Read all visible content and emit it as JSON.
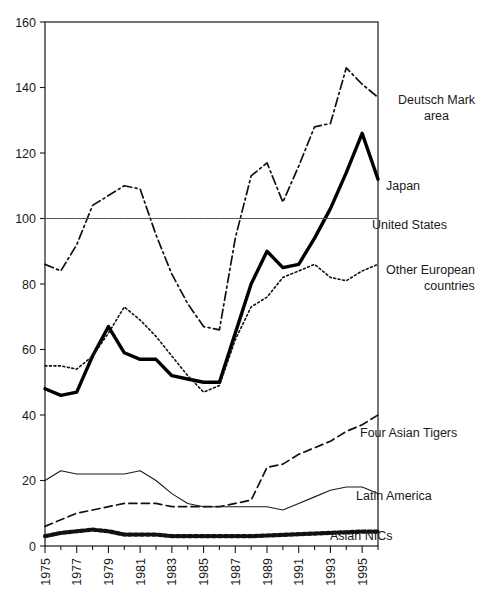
{
  "chart_data": {
    "type": "line",
    "title": "",
    "xlabel": "",
    "ylabel": "",
    "xlim": [
      1975,
      1996
    ],
    "ylim": [
      0,
      160
    ],
    "grid": false,
    "legend_position": "right-inline-labels",
    "x": [
      1975,
      1976,
      1977,
      1978,
      1979,
      1980,
      1981,
      1982,
      1983,
      1984,
      1985,
      1986,
      1987,
      1988,
      1989,
      1990,
      1991,
      1992,
      1993,
      1994,
      1995,
      1996
    ],
    "xtick_labels": [
      "1975",
      "1977",
      "1979",
      "1981",
      "1983",
      "1985",
      "1987",
      "1989",
      "1991",
      "1993",
      "1995"
    ],
    "xtick_values": [
      1975,
      1977,
      1979,
      1981,
      1983,
      1985,
      1987,
      1989,
      1991,
      1993,
      1995
    ],
    "ytick_labels": [
      "0",
      "20",
      "40",
      "60",
      "80",
      "100",
      "120",
      "140",
      "160"
    ],
    "ytick_values": [
      0,
      20,
      40,
      60,
      80,
      100,
      120,
      140,
      160
    ],
    "series": [
      {
        "name": "Deutsch Mark area",
        "label": "Deutsch Mark area",
        "label_lines": [
          "Deutsch Mark",
          "area"
        ],
        "style": "dash-dot",
        "color": "#111111",
        "width": 1.7,
        "values": [
          86,
          84,
          92,
          104,
          107,
          110,
          109,
          95,
          83,
          74,
          67,
          66,
          94,
          113,
          117,
          105,
          116,
          128,
          129,
          146,
          141,
          137
        ]
      },
      {
        "name": "Japan",
        "label": "Japan",
        "label_lines": [
          "Japan"
        ],
        "style": "solid",
        "color": "#000000",
        "width": 3.4,
        "values": [
          48,
          46,
          47,
          58,
          67,
          59,
          57,
          57,
          52,
          51,
          50,
          50,
          65,
          80,
          90,
          85,
          86,
          94,
          103,
          114,
          126,
          112
        ]
      },
      {
        "name": "United States",
        "label": "United States",
        "label_lines": [
          "United States"
        ],
        "style": "solid",
        "color": "#555555",
        "width": 1.0,
        "values": [
          100,
          100,
          100,
          100,
          100,
          100,
          100,
          100,
          100,
          100,
          100,
          100,
          100,
          100,
          100,
          100,
          100,
          100,
          100,
          100,
          100,
          100
        ]
      },
      {
        "name": "Other European countries",
        "label": "Other European countries",
        "label_lines": [
          "Other European",
          "countries"
        ],
        "style": "dotted",
        "color": "#111111",
        "width": 1.6,
        "values": [
          55,
          55,
          54,
          58,
          65,
          73,
          69,
          64,
          58,
          52,
          47,
          49,
          63,
          73,
          76,
          82,
          84,
          86,
          82,
          81,
          84,
          86
        ]
      },
      {
        "name": "Four Asian Tigers",
        "label": "Four Asian Tigers",
        "label_lines": [
          "Four Asian Tigers"
        ],
        "style": "dashed",
        "color": "#111111",
        "width": 1.7,
        "values": [
          6,
          8,
          10,
          11,
          12,
          13,
          13,
          13,
          12,
          12,
          12,
          12,
          13,
          14,
          24,
          25,
          28,
          30,
          32,
          35,
          37,
          40
        ]
      },
      {
        "name": "Latin America",
        "label": "Latin America",
        "label_lines": [
          "Latin America"
        ],
        "style": "solid",
        "color": "#1a1a1a",
        "width": 1.1,
        "values": [
          20,
          23,
          22,
          22,
          22,
          22,
          23,
          20,
          16,
          13,
          12,
          12,
          12,
          12,
          12,
          11,
          13,
          15,
          17,
          18,
          18,
          16
        ]
      },
      {
        "name": "Asian NICs",
        "label": "Asian NICs",
        "label_lines": [
          "Asian NICs"
        ],
        "style": "dotted-thick",
        "color": "#111111",
        "width": 4.2,
        "values": [
          3,
          4,
          4.5,
          5,
          4.5,
          3.5,
          3.5,
          3.5,
          3,
          3,
          3,
          3,
          3,
          3,
          3.2,
          3.4,
          3.6,
          3.8,
          4,
          4.2,
          4.4,
          4.4
        ]
      }
    ],
    "annotations": [
      {
        "name": "Deutsch Mark area",
        "x": 398,
        "y": 104,
        "align": "start"
      },
      {
        "name": "Deutsch Mark area line2",
        "x": 424,
        "y": 120,
        "align": "middle"
      },
      {
        "name": "Japan",
        "x": 386,
        "y": 190,
        "align": "start"
      },
      {
        "name": "United States",
        "x": 372,
        "y": 229,
        "align": "start"
      },
      {
        "name": "Other European countries",
        "x": 386,
        "y": 274,
        "align": "start"
      },
      {
        "name": "Other European countries line2",
        "x": 424,
        "y": 290,
        "align": "middle"
      },
      {
        "name": "Four Asian Tigers",
        "x": 360,
        "y": 437,
        "align": "start"
      },
      {
        "name": "Latin America",
        "x": 356,
        "y": 500,
        "align": "start"
      },
      {
        "name": "Asian NICs",
        "x": 330,
        "y": 540,
        "align": "start"
      }
    ]
  }
}
